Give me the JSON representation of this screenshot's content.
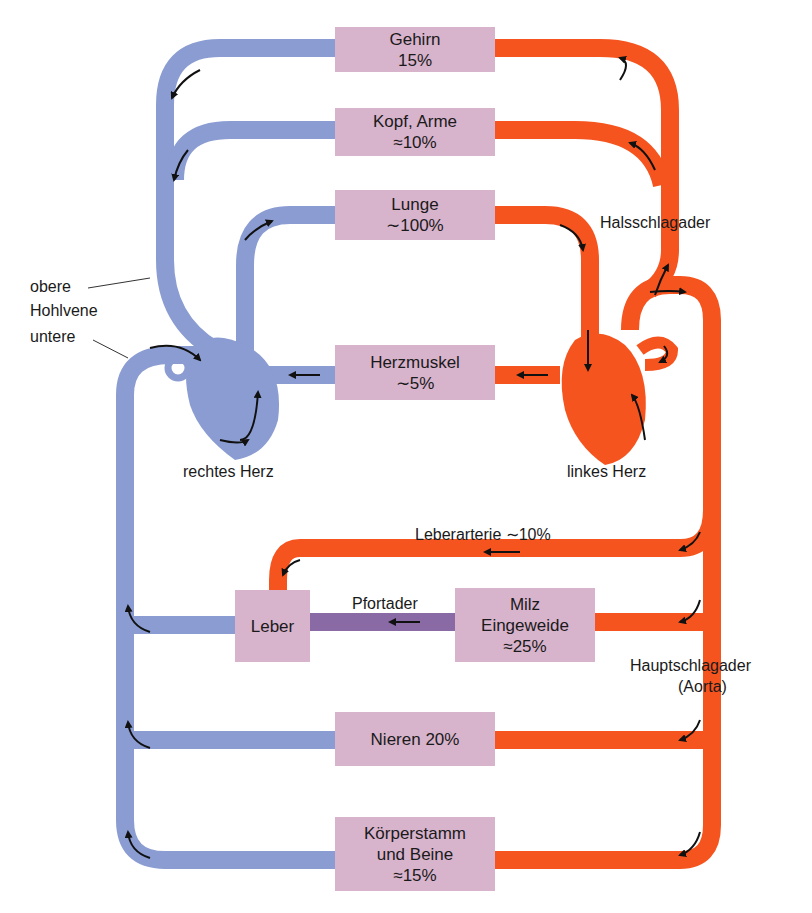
{
  "colors": {
    "venous": "#8a9cd1",
    "arterial": "#f5541f",
    "portal": "#8a6aa4",
    "organ_box": "#d8b3cc",
    "arrow": "#111111"
  },
  "organs": {
    "gehirn": {
      "name": "Gehirn",
      "value": "15%"
    },
    "kopf_arme": {
      "name": "Kopf, Arme",
      "value": "≈10%"
    },
    "lunge": {
      "name": "Lunge",
      "value": "∼100%"
    },
    "herzmuskel": {
      "name": "Herzmuskel",
      "value": "∼5%"
    },
    "leber": {
      "name": "Leber"
    },
    "milz": {
      "name": "Milz",
      "name2": "Eingeweide",
      "value": "≈25%"
    },
    "nieren": {
      "name": "Nieren 20%"
    },
    "koerper": {
      "name": "Körperstamm",
      "name2": "und Beine",
      "value": "≈15%"
    }
  },
  "labels": {
    "obere": "obere",
    "hohlvene": "Hohlvene",
    "untere": "untere",
    "rechtes_herz": "rechtes Herz",
    "linkes_herz": "linkes Herz",
    "halsschlagader": "Halsschlagader",
    "leberarterie": "Leberarterie ∼10%",
    "pfortader": "Pfortader",
    "hauptschlagader": "Hauptschlagader",
    "aorta": "(Aorta)"
  }
}
